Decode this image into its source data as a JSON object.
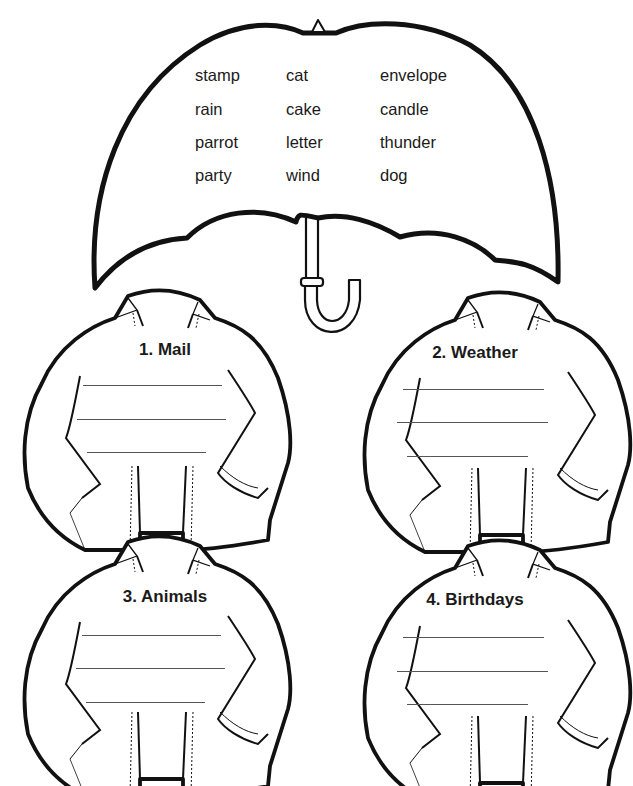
{
  "instructions_fragment": "",
  "umbrella": {
    "words": [
      [
        "stamp",
        "cat",
        "envelope"
      ],
      [
        "rain",
        "cake",
        "candle"
      ],
      [
        "parrot",
        "letter",
        "thunder"
      ],
      [
        "party",
        "wind",
        "dog"
      ]
    ]
  },
  "sweaters": [
    {
      "title": "1. Mail",
      "lines": 3
    },
    {
      "title": "2. Weather",
      "lines": 3
    },
    {
      "title": "3. Animals",
      "lines": 3
    },
    {
      "title": "4. Birthdays",
      "lines": 3
    }
  ],
  "colors": {
    "ink": "#111111",
    "background": "#ffffff",
    "rule": "#555555"
  }
}
